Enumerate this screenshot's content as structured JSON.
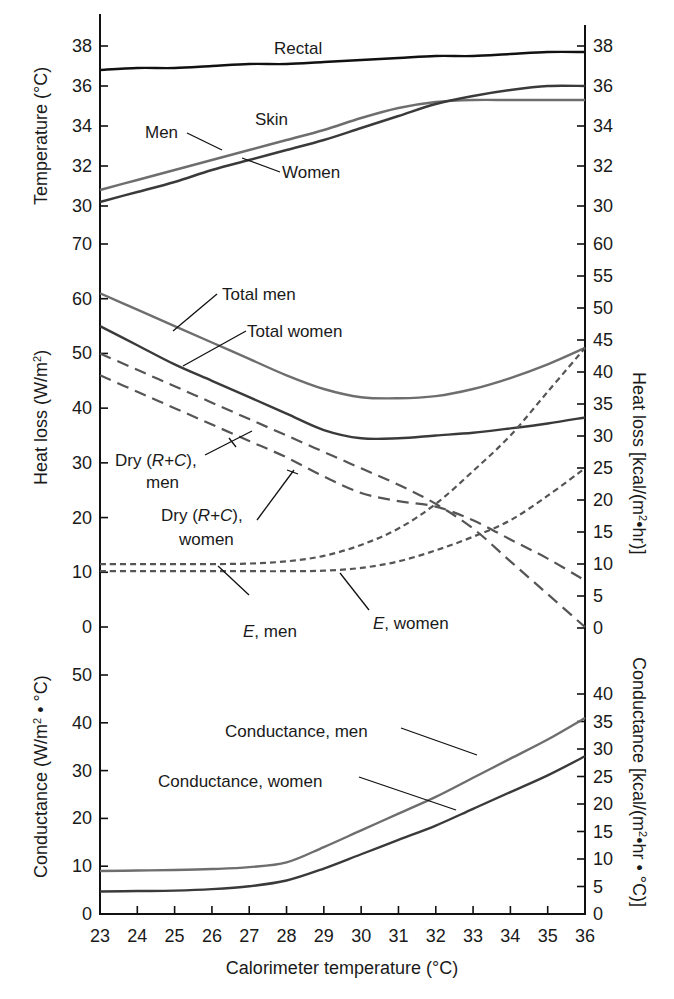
{
  "chart_data": [
    {
      "type": "line",
      "panel": "top",
      "title": "",
      "xlabel": "Calorimeter temperature (°C)",
      "ylabel": "Temperature (°C)",
      "ylabel_right": "",
      "x": [
        23,
        24,
        25,
        26,
        27,
        28,
        29,
        30,
        31,
        32,
        33,
        34,
        35,
        36
      ],
      "ylim": [
        30,
        38
      ],
      "yticks_left": [
        30,
        32,
        34,
        36,
        38
      ],
      "yticks_right": [
        30,
        32,
        34,
        36,
        38
      ],
      "series": [
        {
          "name": "Rectal",
          "style": "solid",
          "color": "#111111",
          "values": [
            36.8,
            36.9,
            36.9,
            37.0,
            37.1,
            37.1,
            37.2,
            37.3,
            37.4,
            37.5,
            37.5,
            37.6,
            37.7,
            37.7
          ]
        },
        {
          "name": "Skin, Men",
          "style": "solid",
          "color": "#6e6e6e",
          "values": [
            30.8,
            31.3,
            31.8,
            32.3,
            32.8,
            33.3,
            33.8,
            34.4,
            34.9,
            35.2,
            35.3,
            35.3,
            35.3,
            35.3
          ]
        },
        {
          "name": "Skin, Women",
          "style": "solid",
          "color": "#3a3a3a",
          "values": [
            30.2,
            30.7,
            31.2,
            31.8,
            32.3,
            32.8,
            33.3,
            33.9,
            34.5,
            35.1,
            35.5,
            35.8,
            36.0,
            36.0
          ]
        }
      ],
      "annotations": [
        "Rectal",
        "Skin",
        "Men",
        "Women"
      ]
    },
    {
      "type": "line",
      "panel": "middle",
      "xlabel": "Calorimeter temperature (°C)",
      "ylabel": "Heat loss (W/m²)",
      "ylabel_right": "Heat loss [kcal/(m²•hr)]",
      "x": [
        23,
        24,
        25,
        26,
        27,
        28,
        29,
        30,
        31,
        32,
        33,
        34,
        35,
        36
      ],
      "ylim": [
        0,
        70
      ],
      "yticks_left": [
        0,
        10,
        20,
        30,
        40,
        50,
        60,
        70
      ],
      "yticks_right": [
        0,
        5,
        10,
        15,
        20,
        25,
        30,
        35,
        40,
        45,
        50,
        55,
        60
      ],
      "series": [
        {
          "name": "Total men",
          "style": "solid",
          "color": "#6e6e6e",
          "values": [
            61,
            58,
            55,
            52,
            49,
            46,
            43.5,
            42,
            41.8,
            42.2,
            43.5,
            45.5,
            48,
            51
          ]
        },
        {
          "name": "Total women",
          "style": "solid",
          "color": "#3a3a3a",
          "values": [
            55,
            51.5,
            48,
            45,
            42,
            39,
            36,
            34.5,
            34.5,
            35,
            35.5,
            36.3,
            37.2,
            38.3
          ]
        },
        {
          "name": "Dry (R+C), men",
          "style": "dashed",
          "color": "#555555",
          "values": [
            50,
            47,
            44,
            41,
            38,
            35,
            32,
            29,
            26,
            22.5,
            18,
            12,
            6,
            0
          ]
        },
        {
          "name": "Dry (R+C), women",
          "style": "dashed",
          "color": "#555555",
          "values": [
            46,
            43,
            40,
            37,
            34,
            31,
            27.5,
            24.5,
            23,
            22,
            19.5,
            16,
            12.5,
            8.5
          ]
        },
        {
          "name": "E, men",
          "style": "dotted",
          "color": "#555555",
          "values": [
            11.5,
            11.5,
            11.5,
            11.5,
            11.6,
            12,
            13,
            15,
            18,
            22.5,
            28.5,
            35,
            43,
            51
          ]
        },
        {
          "name": "E, women",
          "style": "dotted",
          "color": "#555555",
          "values": [
            10.2,
            10.2,
            10.2,
            10.2,
            10.2,
            10.2,
            10.3,
            10.8,
            12,
            14,
            16.5,
            19.5,
            24,
            29
          ]
        }
      ],
      "annotations": [
        "Total men",
        "Total women",
        "Dry (R+C), men",
        "Dry (R+C), women",
        "E, men",
        "E, women"
      ]
    },
    {
      "type": "line",
      "panel": "bottom",
      "xlabel": "Calorimeter temperature (°C)",
      "ylabel": "Conductance (W/m² • °C)",
      "ylabel_right": "Conductance [kcal/(m²•hr • °C)]",
      "x": [
        23,
        24,
        25,
        26,
        27,
        28,
        29,
        30,
        31,
        32,
        33,
        34,
        35,
        36
      ],
      "ylim": [
        0,
        50
      ],
      "yticks_left": [
        0,
        10,
        20,
        30,
        40,
        50
      ],
      "yticks_right": [
        0,
        5,
        10,
        15,
        20,
        25,
        30,
        35,
        40
      ],
      "series": [
        {
          "name": "Conductance, men",
          "style": "solid",
          "color": "#6e6e6e",
          "values": [
            9,
            9.1,
            9.2,
            9.4,
            9.8,
            10.8,
            14,
            17.5,
            21,
            24.5,
            28.5,
            32.5,
            36.5,
            41
          ]
        },
        {
          "name": "Conductance, women",
          "style": "solid",
          "color": "#3a3a3a",
          "values": [
            4.7,
            4.8,
            4.9,
            5.2,
            5.8,
            7,
            9.5,
            12.5,
            15.5,
            18.5,
            22,
            25.5,
            29,
            33
          ]
        }
      ],
      "annotations": [
        "Conductance, men",
        "Conductance, women"
      ]
    }
  ],
  "labels": {
    "rectal": "Rectal",
    "skin": "Skin",
    "men": "Men",
    "women": "Women",
    "total_men": "Total men",
    "total_women": "Total women",
    "dry_men_l1": "Dry (",
    "dry_rc": "R+C",
    "dry_close": "),",
    "dry_men_l2": "men",
    "dry_women_l2": "women",
    "e": "E",
    "e_men": ", men",
    "e_women": ", women",
    "cond_men": "Conductance, men",
    "cond_women": "Conductance, women",
    "ylabel_top": "Temperature (°C)",
    "ylabel_mid": "Heat loss (W/m",
    "ylabel_mid_sup": "2",
    "ylabel_mid_close": ")",
    "ylabel_mid_right": "Heat loss [kcal/(m",
    "ylabel_mid_right_sup": "2",
    "ylabel_mid_right_close": "•hr)]",
    "ylabel_bot": "Conductance (W/m",
    "ylabel_bot_sup": "2",
    "ylabel_bot_close": " • °C)",
    "ylabel_bot_right": "Conductance [kcal/(m",
    "ylabel_bot_right_sup": "2",
    "ylabel_bot_right_close": "•hr • °C)]",
    "xlabel": "Calorimeter temperature (°C)"
  }
}
